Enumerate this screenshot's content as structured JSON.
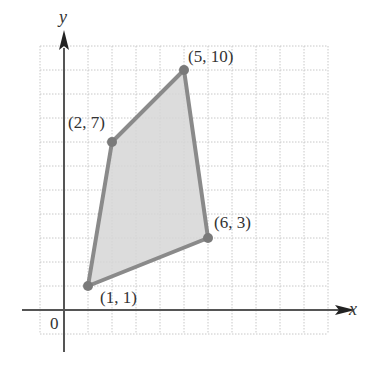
{
  "diagram": {
    "type": "coordinate-plane-polygon",
    "axes": {
      "x_label": "x",
      "y_label": "y",
      "origin_label": "0",
      "x_range": [
        -1,
        11
      ],
      "y_range": [
        -1,
        11
      ],
      "grid_step": 1
    },
    "polygon": {
      "vertices": [
        {
          "x": 1,
          "y": 1,
          "label": "(1, 1)"
        },
        {
          "x": 2,
          "y": 7,
          "label": "(2, 7)"
        },
        {
          "x": 5,
          "y": 10,
          "label": "(5, 10)"
        },
        {
          "x": 6,
          "y": 3,
          "label": "(6, 3)"
        }
      ],
      "fill_color": "#d6d6d6",
      "stroke_color": "#8a8a8a"
    },
    "colors": {
      "grid": "#c8c8c8",
      "axis": "#555555",
      "text": "#333333"
    }
  }
}
